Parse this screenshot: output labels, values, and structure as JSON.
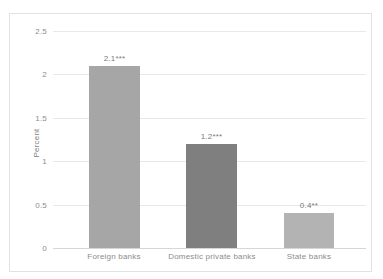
{
  "chart_data": {
    "type": "bar",
    "title": "",
    "xlabel": "",
    "ylabel": "Percent",
    "categories": [
      "Foreign banks",
      "Domestic private banks",
      "State banks"
    ],
    "values": [
      2.1,
      1.2,
      0.4
    ],
    "data_labels": [
      "2.1***",
      "1.2***",
      "0.4**"
    ],
    "bar_colors": [
      "#a6a6a6",
      "#7f7f7f",
      "#b3b3b3"
    ],
    "ylim": [
      0,
      2.5
    ],
    "yticks": [
      "0",
      "0.5",
      "1",
      "1.5",
      "2",
      "2.5"
    ],
    "ytick_values": [
      0,
      0.5,
      1,
      1.5,
      2,
      2.5
    ],
    "grid": true,
    "legend": "none",
    "gridline_color": "#e8e8e8",
    "axis_color": "#d6d6d6",
    "text_color": "#8c8c8c",
    "border_color": "#e2e2e2",
    "background": "#ffffff"
  }
}
